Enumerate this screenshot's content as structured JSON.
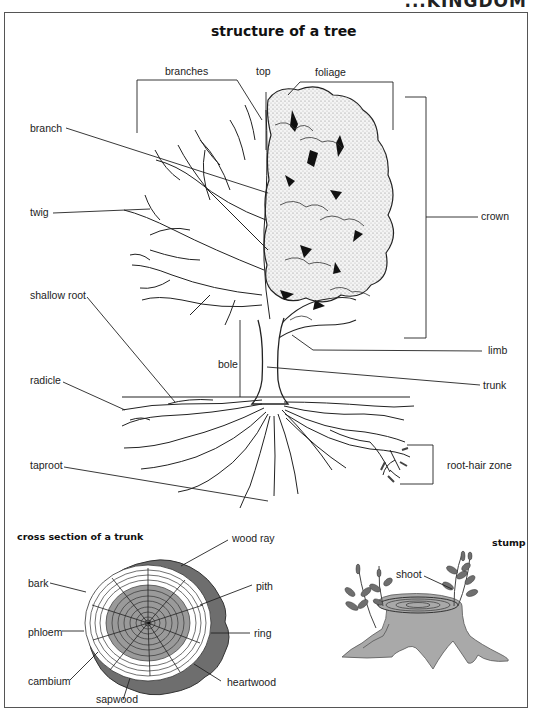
{
  "running_head": "...KINGDOM",
  "main_diagram": {
    "title": "structure of a tree",
    "labels": {
      "branches": "branches",
      "top": "top",
      "foliage": "foliage",
      "branch": "branch",
      "twig": "twig",
      "crown": "crown",
      "shallow_root": "shallow root",
      "limb": "limb",
      "bole": "bole",
      "radicle": "radicle",
      "trunk": "trunk",
      "taproot": "taproot",
      "root_hair_zone": "root-hair zone"
    }
  },
  "cross_section": {
    "title": "cross section of a trunk",
    "labels": {
      "wood_ray": "wood ray",
      "bark": "bark",
      "pith": "pith",
      "phloem": "phloem",
      "ring": "ring",
      "cambium": "cambium",
      "heartwood": "heartwood",
      "sapwood": "sapwood"
    },
    "colors": {
      "bark": "#6e6e6e",
      "heartwood": "#9a9a9a",
      "sapwood": "#ffffff"
    }
  },
  "stump": {
    "title": "stump",
    "labels": {
      "shoot": "shoot"
    },
    "colors": {
      "stump": "#a9a9a9",
      "leaf": "#6f6f6f"
    }
  }
}
